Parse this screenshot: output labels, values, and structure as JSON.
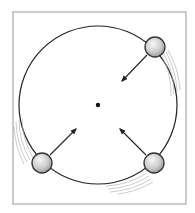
{
  "diagram": {
    "frame": {
      "x": 13,
      "y": 12,
      "width": 173,
      "height": 192,
      "stroke": "#9a9a9a"
    },
    "orbit": {
      "cx": 98,
      "cy": 105,
      "r": 79,
      "stroke": "#222222"
    },
    "center": {
      "x": 98,
      "y": 105,
      "r": 2.2,
      "fill": "#111111"
    },
    "balls": [
      {
        "id": "top-right",
        "x": 155,
        "y": 47,
        "r": 10,
        "arrow_to": [
          122,
          81
        ]
      },
      {
        "id": "bottom-left",
        "x": 42,
        "y": 163,
        "r": 10,
        "arrow_to": [
          76,
          129
        ]
      },
      {
        "id": "bottom-right",
        "x": 154,
        "y": 163,
        "r": 10,
        "arrow_to": [
          120,
          129
        ]
      }
    ],
    "colors": {
      "ball_fill": "#cfcfcf",
      "ball_highlight": "#f5f5f5",
      "ball_stroke": "#333333",
      "arrow": "#222222",
      "motion_lines": "#aaaaaa"
    }
  }
}
